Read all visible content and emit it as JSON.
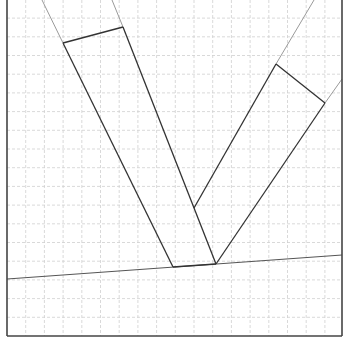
{
  "diagram": {
    "width": 344,
    "height": 349,
    "background": "#ffffff",
    "frame": {
      "x1": 7,
      "y1": 0,
      "x2": 342,
      "y2": 336,
      "color": "#444444",
      "stroke_width": 1.6
    },
    "grid": {
      "spacing": 18.7,
      "origin_x": 7,
      "origin_y": 336,
      "color": "#cfcfcf",
      "dash": "3,2"
    },
    "baseline": {
      "x1": 7,
      "y1": 279,
      "x2": 342,
      "y2": 255,
      "color": "#555555"
    },
    "left_bar": {
      "dark_edges": [
        {
          "x1": 63,
          "y1": 43,
          "x2": 173,
          "y2": 267
        },
        {
          "x1": 123,
          "y1": 27,
          "x2": 216,
          "y2": 264
        },
        {
          "x1": 63,
          "y1": 43,
          "x2": 123,
          "y2": 27
        },
        {
          "x1": 173,
          "y1": 267,
          "x2": 216,
          "y2": 264
        }
      ],
      "gray_extensions": [
        {
          "x1": 63,
          "y1": 43,
          "x2": 42,
          "y2": 0
        },
        {
          "x1": 123,
          "y1": 27,
          "x2": 112,
          "y2": 0
        }
      ]
    },
    "right_bar": {
      "dark_edges": [
        {
          "x1": 276,
          "y1": 64,
          "x2": 194,
          "y2": 208
        },
        {
          "x1": 325,
          "y1": 103,
          "x2": 216,
          "y2": 264
        },
        {
          "x1": 276,
          "y1": 64,
          "x2": 325,
          "y2": 103
        }
      ],
      "gray_extensions": [
        {
          "x1": 276,
          "y1": 64,
          "x2": 314,
          "y2": 0
        },
        {
          "x1": 325,
          "y1": 103,
          "x2": 342,
          "y2": 79
        }
      ]
    },
    "colors": {
      "dark": "#333333",
      "gray": "#9a9a9a"
    }
  }
}
